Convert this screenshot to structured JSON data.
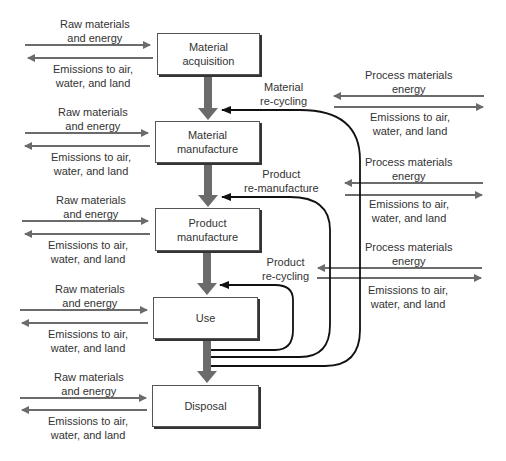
{
  "stages": [
    {
      "id": "acquisition",
      "label": "Material acquisition",
      "line1": "Material",
      "line2": "acquisition"
    },
    {
      "id": "material-manufacture",
      "label": "Material manufacture",
      "line1": "Material",
      "line2": "manufacture"
    },
    {
      "id": "product-manufacture",
      "label": "Product manufacture",
      "line1": "Product",
      "line2": "manufacture"
    },
    {
      "id": "use",
      "label": "Use",
      "line1": "Use",
      "line2": ""
    },
    {
      "id": "disposal",
      "label": "Disposal",
      "line1": "Disposal",
      "line2": ""
    }
  ],
  "left_io": {
    "input_line1": "Raw materials",
    "input_line2": "and energy",
    "output_line1": "Emissions to air,",
    "output_line2": "water, and land"
  },
  "right_io": {
    "input_line1": "Process materials",
    "input_line2": "energy",
    "output_line1": "Emissions to air,",
    "output_line2": "water, and land"
  },
  "loops": [
    {
      "id": "material-recycling",
      "line1": "Material",
      "line2": "re-cycling"
    },
    {
      "id": "product-remanufacture",
      "line1": "Product",
      "line2": "re-manufacture"
    },
    {
      "id": "product-recycling",
      "line1": "Product",
      "line2": "re-cycling"
    }
  ],
  "colors": {
    "thin_arrow": "#6b6b6b",
    "thick_arrow": "#6b6b6b",
    "loop_line": "#111111",
    "box_border": "#555555"
  }
}
